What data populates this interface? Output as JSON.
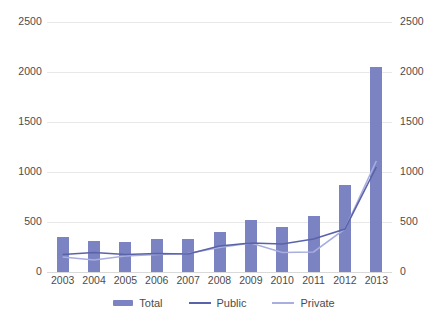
{
  "chart_data": {
    "type": "bar",
    "title": "",
    "xlabel": "",
    "ylabel": "",
    "ylim": [
      0,
      2500
    ],
    "y2lim": [
      0,
      2500
    ],
    "grid": true,
    "legend_position": "bottom",
    "categories": [
      "2003",
      "2004",
      "2005",
      "2006",
      "2007",
      "2008",
      "2009",
      "2010",
      "2011",
      "2012",
      "2013"
    ],
    "yticks": [
      "0",
      "500",
      "1000",
      "1500",
      "2000",
      "2500"
    ],
    "y2ticks": [
      "0",
      "500",
      "1000",
      "1500",
      "2000",
      "2500"
    ],
    "series": [
      {
        "name": "Total",
        "kind": "bar",
        "color": "#7b83c3",
        "values": [
          350,
          310,
          300,
          330,
          330,
          400,
          520,
          450,
          560,
          870,
          2050
        ]
      },
      {
        "name": "Public",
        "kind": "line",
        "color": "#5b63a8",
        "values": [
          175,
          195,
          175,
          185,
          180,
          260,
          290,
          280,
          330,
          430,
          1050
        ]
      },
      {
        "name": "Private",
        "kind": "line",
        "color": "#a8aede",
        "values": [
          150,
          120,
          160,
          175,
          185,
          245,
          290,
          195,
          200,
          430,
          1110
        ]
      }
    ]
  },
  "legend": {
    "items": [
      {
        "label": "Total",
        "color": "#7b83c3",
        "marker": "bar-swatch"
      },
      {
        "label": "Public",
        "color": "#5b63a8",
        "marker": "line-swatch"
      },
      {
        "label": "Private",
        "color": "#a8aede",
        "marker": "line-swatch"
      }
    ]
  }
}
